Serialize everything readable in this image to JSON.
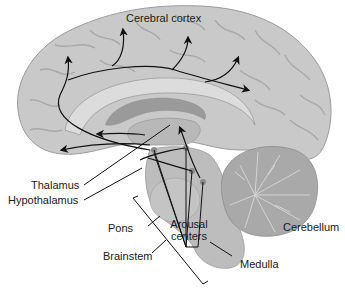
{
  "diagram": {
    "type": "labeled anatomical illustration",
    "labels": {
      "cerebral_cortex": "Cerebral cortex",
      "thalamus": "Thalamus",
      "hypothalamus": "Hypothalamus",
      "pons": "Pons",
      "arousal_centers_line1": "Arousal",
      "arousal_centers_line2": "centers",
      "cerebellum": "Cerebellum",
      "brainstem": "Brainstem",
      "medulla": "Medulla"
    },
    "colors": {
      "background": "#ffffff",
      "cortex": "#c9c9c9",
      "cortex_light": "#dcdcdc",
      "sulci": "#a8a8a8",
      "inner_dark": "#9a9a9a",
      "inner_mid": "#b8b8b8",
      "brainstem": "#bdbdbd",
      "cerebellum": "#a9a9a9",
      "arousal_dot": "#8a8a8a",
      "lines": "#111111",
      "text": "#1a1a1a"
    }
  }
}
